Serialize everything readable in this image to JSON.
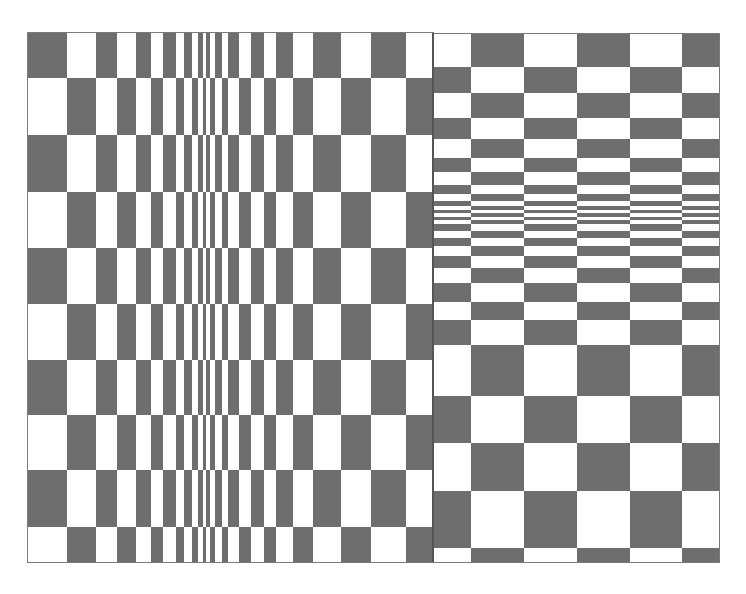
{
  "figure": {
    "colors": {
      "dark": "#6e6e6e",
      "light": "#ffffff",
      "border": "#7a7a7a"
    },
    "left_panel": {
      "x_edges": [
        28,
        67,
        96,
        117,
        136,
        151,
        163,
        176,
        184,
        192,
        198,
        203,
        206,
        210,
        215,
        222,
        228,
        239,
        251,
        264,
        276,
        293,
        313,
        341,
        371,
        406,
        433
      ],
      "y_edges": [
        33,
        78,
        135,
        192,
        248,
        304,
        360,
        415,
        470,
        527,
        562
      ],
      "first_cell_dark": true
    },
    "right_panel": {
      "x_edges": [
        433,
        471,
        524,
        577,
        630,
        682,
        719
      ],
      "y_edges": [
        34,
        67,
        93,
        118,
        139,
        158,
        172,
        185,
        194,
        201,
        206,
        210,
        213,
        217,
        220,
        224,
        231,
        238,
        246,
        256,
        268,
        283,
        302,
        320,
        345,
        396,
        443,
        491,
        548,
        562
      ],
      "first_cell_dark": false
    }
  }
}
